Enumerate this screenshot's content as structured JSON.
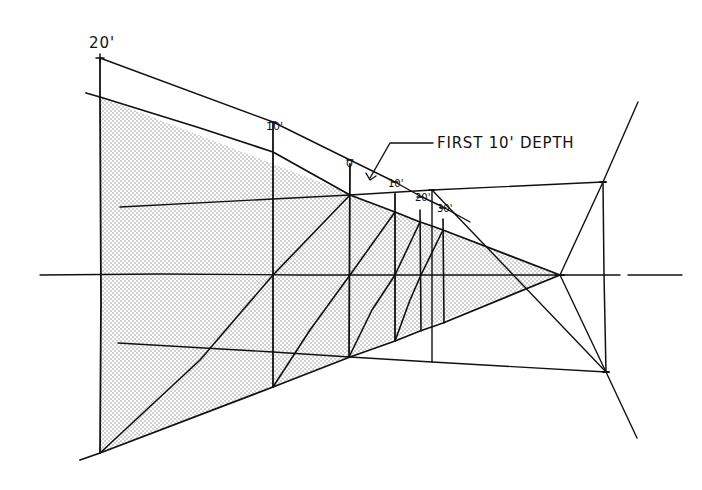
{
  "figure": {
    "type": "perspective-construction-sketch",
    "colors": {
      "ink": "#111111",
      "background": "#ffffff",
      "stipple": "#9a9a9a"
    }
  },
  "labels": {
    "height_marker": "20'",
    "measure_10_top": "10'",
    "measure_zero": "0",
    "depth_10": "10'",
    "depth_20": "20'",
    "depth_30": "30'",
    "callout": "FIRST 10' DEPTH"
  },
  "geometry": {
    "horizon_y": 275,
    "vanishing_point": [
      560,
      275
    ],
    "picture_plane_x": 100,
    "depth_verticals_x": [
      273,
      350,
      395,
      420,
      432,
      443
    ]
  }
}
